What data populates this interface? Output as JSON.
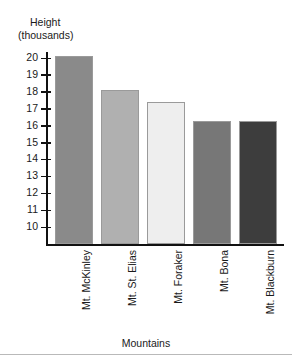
{
  "chart_data": {
    "type": "bar",
    "title": "",
    "ylabel": "Height\n(thousands)",
    "ylabel_line1": "Height",
    "ylabel_line2": "(thousands)",
    "xlabel": "Mountains",
    "categories": [
      "Mt. McKinley",
      "Mt. St. Elias",
      "Mt. Foraker",
      "Mt. Bona",
      "Mt. Blackburn"
    ],
    "values": [
      20.1,
      18.1,
      17.4,
      16.3,
      16.3
    ],
    "bar_colors": [
      "#8a8a8a",
      "#b0b0b0",
      "#eeeeee",
      "#777777",
      "#3d3d3d"
    ],
    "bar_border_color": "#9a9a9a",
    "ylim": [
      9.4,
      20.6
    ],
    "ytick_labels": [
      "20",
      "19",
      "18",
      "17",
      "16",
      "15",
      "14",
      "13",
      "12",
      "11",
      "10"
    ],
    "ytick_values": [
      20,
      19,
      18,
      17,
      16,
      15,
      14,
      13,
      12,
      11,
      10
    ],
    "ytick_step": 1,
    "grid": false,
    "legend": "none",
    "axis_color": "#111111"
  }
}
